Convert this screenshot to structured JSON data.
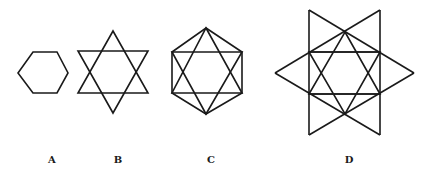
{
  "figures": [
    {
      "id": "A",
      "label": "A",
      "description": "Regular hexagon",
      "label_x": 52
    },
    {
      "id": "B",
      "label": "B",
      "description": "Hexagram (six-pointed star)",
      "label_x": 118
    },
    {
      "id": "C",
      "label": "C",
      "description": "Hexagon with inscribed hexagram",
      "label_x": 211
    },
    {
      "id": "D",
      "label": "D",
      "description": "Hexagram with extended lines forming outer star",
      "label_x": 349
    }
  ],
  "colors": {
    "stroke": "#1a1a1a",
    "background": "#ffffff"
  }
}
